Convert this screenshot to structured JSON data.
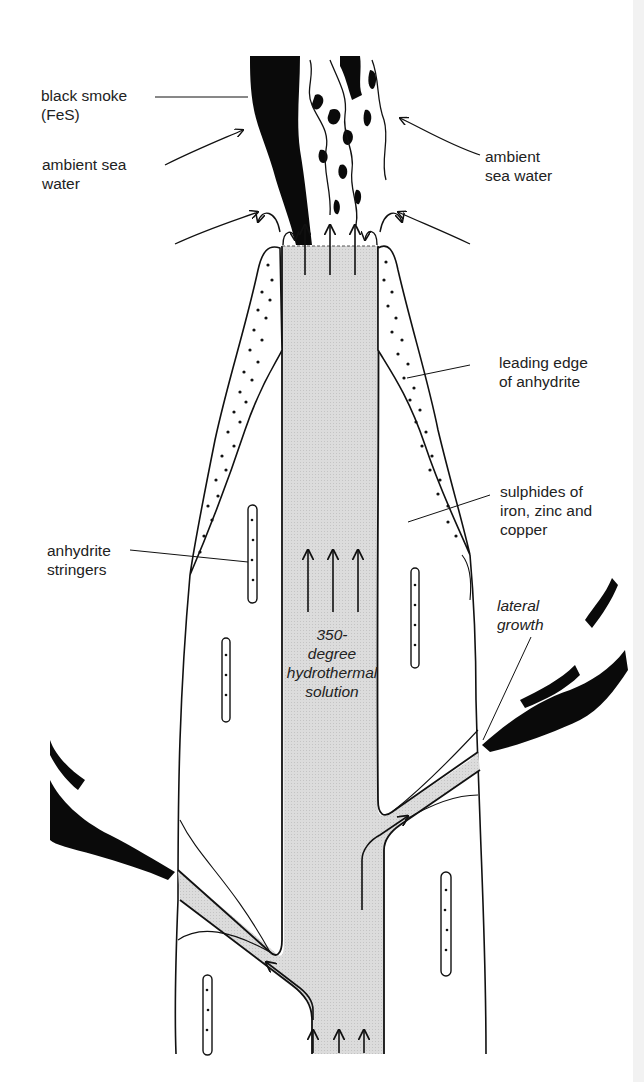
{
  "figure": {
    "colors": {
      "ink": "#111111",
      "fluid_fill": "#d9d9d9",
      "background": "#ffffff",
      "smoke": "#0a0a0a"
    }
  },
  "labels": {
    "black_smoke": "black smoke\n(FeS)",
    "ambient_left": "ambient sea\nwater",
    "ambient_right": "ambient\nsea water",
    "leading_edge": "leading edge\nof anhydrite",
    "sulphides": "sulphides of\niron, zinc and\ncopper",
    "anhydrite_stringers": "anhydrite\nstringers",
    "lateral_growth": "lateral\ngrowth",
    "solution": "350-\ndegree\nhydrothermal\nsolution"
  }
}
